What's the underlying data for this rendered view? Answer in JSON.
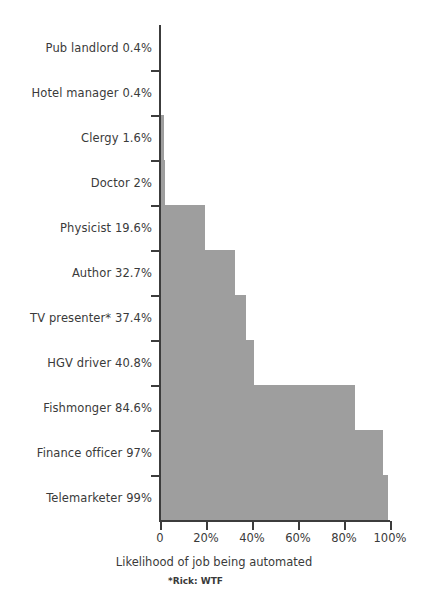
{
  "chart_data": {
    "type": "bar",
    "orientation": "horizontal",
    "title": "",
    "xlabel": "Likelihood of job being automated",
    "ylabel": "",
    "xlim": [
      0,
      100
    ],
    "grid": false,
    "legend": null,
    "bar_color": "#9e9e9e",
    "axis_color": "#3c3c3c",
    "background": "#ffffff",
    "footnote": "*Rick: WTF",
    "categories": [
      "Pub landlord",
      "Hotel manager",
      "Clergy",
      "Doctor",
      "Physicist",
      "Author",
      "TV presenter*",
      "HGV driver",
      "Fishmonger",
      "Finance officer",
      "Telemarketer"
    ],
    "values": [
      0.4,
      0.4,
      1.6,
      2,
      19.6,
      32.7,
      37.4,
      40.8,
      84.6,
      97,
      99
    ],
    "category_labels": [
      "Pub landlord 0.4%",
      "Hotel manager 0.4%",
      "Clergy 1.6%",
      "Doctor 2%",
      "Physicist 19.6%",
      "Author 32.7%",
      "TV presenter* 37.4%",
      "HGV driver 40.8%",
      "Fishmonger 84.6%",
      "Finance officer 97%",
      "Telemarketer 99%"
    ],
    "xticks": [
      0,
      20,
      40,
      60,
      80,
      100
    ],
    "xtick_labels": [
      "0",
      "20%",
      "40%",
      "60%",
      "80%",
      "100%"
    ]
  }
}
